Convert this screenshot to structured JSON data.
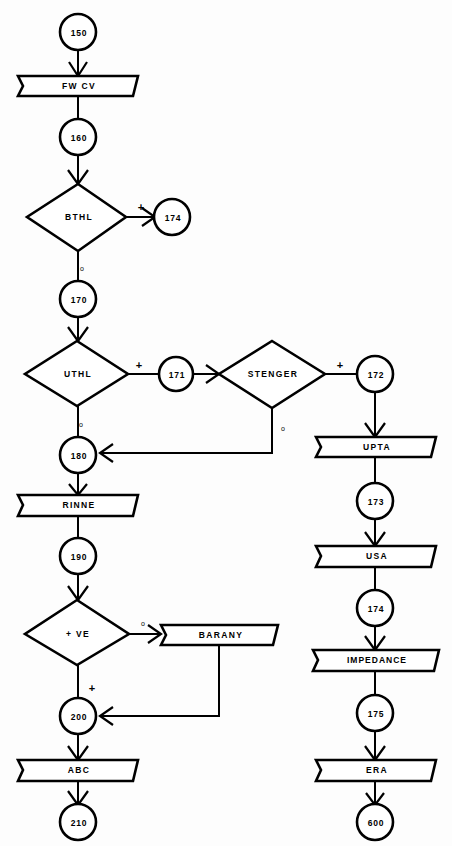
{
  "diagram": {
    "background_color": "#fdfdfd",
    "line_color": "#000000",
    "shape_fill": "#ffffff",
    "branch_markers": {
      "positive": "+",
      "negative": "o"
    }
  },
  "nodes": {
    "n150": {
      "label": "150",
      "shape": "connector",
      "cx": 78,
      "cy": 32
    },
    "fwcv": {
      "label": "FW CV",
      "shape": "process",
      "cx": 78,
      "cy": 86
    },
    "n160": {
      "label": "160",
      "shape": "connector",
      "cx": 78,
      "cy": 137
    },
    "bthl": {
      "label": "BTHL",
      "shape": "decision",
      "cx": 78,
      "cy": 217
    },
    "n174a": {
      "label": "174",
      "shape": "connector",
      "cx": 172,
      "cy": 217
    },
    "n170": {
      "label": "170",
      "shape": "connector",
      "cx": 78,
      "cy": 299
    },
    "uthl": {
      "label": "UTHL",
      "shape": "decision",
      "cx": 77,
      "cy": 374
    },
    "n171": {
      "label": "171",
      "shape": "connector",
      "cx": 176,
      "cy": 375
    },
    "steng": {
      "label": "STENGER",
      "shape": "decision",
      "cx": 272,
      "cy": 374
    },
    "n172": {
      "label": "172",
      "shape": "connector",
      "cx": 375,
      "cy": 375
    },
    "upta": {
      "label": "UPTA",
      "shape": "process",
      "cx": 375,
      "cy": 447
    },
    "n173": {
      "label": "173",
      "shape": "connector",
      "cx": 375,
      "cy": 501
    },
    "usa": {
      "label": "USA",
      "shape": "process",
      "cx": 375,
      "cy": 556
    },
    "n174b": {
      "label": "174",
      "shape": "connector",
      "cx": 375,
      "cy": 608
    },
    "imped": {
      "label": "IMPEDANCE",
      "shape": "process",
      "cx": 375,
      "cy": 660
    },
    "n175": {
      "label": "175",
      "shape": "connector",
      "cx": 375,
      "cy": 713
    },
    "era": {
      "label": "ERA",
      "shape": "process",
      "cx": 375,
      "cy": 770
    },
    "n600": {
      "label": "600",
      "shape": "connector",
      "cx": 375,
      "cy": 822
    },
    "n180": {
      "label": "180",
      "shape": "connector",
      "cx": 78,
      "cy": 455
    },
    "rinne": {
      "label": "RINNE",
      "shape": "process",
      "cx": 78,
      "cy": 505
    },
    "n190": {
      "label": "190",
      "shape": "connector",
      "cx": 78,
      "cy": 556
    },
    "ve": {
      "label": "+ VE",
      "shape": "decision",
      "cx": 77,
      "cy": 632
    },
    "baran": {
      "label": "BARANY",
      "shape": "process",
      "cx": 219,
      "cy": 635
    },
    "n200": {
      "label": "200",
      "shape": "connector",
      "cx": 78,
      "cy": 716
    },
    "abc": {
      "label": "ABC",
      "shape": "process",
      "cx": 78,
      "cy": 770
    },
    "n210": {
      "label": "210",
      "shape": "connector",
      "cx": 78,
      "cy": 822
    }
  },
  "branch_labels": [
    {
      "id": "bthl-plus",
      "text": "+",
      "x": 141,
      "y": 207
    },
    {
      "id": "bthl-o",
      "text": "o",
      "x": 82,
      "y": 268
    },
    {
      "id": "uthl-plus",
      "text": "+",
      "x": 139,
      "y": 365
    },
    {
      "id": "uthl-o",
      "text": "o",
      "x": 81,
      "y": 424
    },
    {
      "id": "stenger-plus",
      "text": "+",
      "x": 340,
      "y": 365
    },
    {
      "id": "stenger-o",
      "text": "o",
      "x": 283,
      "y": 428
    },
    {
      "id": "ve-o",
      "text": "o",
      "x": 143,
      "y": 623
    },
    {
      "id": "ve-plus",
      "text": "+",
      "x": 92,
      "y": 688
    }
  ],
  "edges": [
    {
      "id": "e-150-fwcv",
      "from": "150",
      "to": "FW CV"
    },
    {
      "id": "e-fwcv-160",
      "from": "FW CV",
      "to": "160"
    },
    {
      "id": "e-160-bthl",
      "from": "160",
      "to": "BTHL"
    },
    {
      "id": "e-bthl-174",
      "from": "BTHL",
      "to": "174",
      "branch": "+"
    },
    {
      "id": "e-bthl-170",
      "from": "BTHL",
      "to": "170",
      "branch": "o"
    },
    {
      "id": "e-170-uthl",
      "from": "170",
      "to": "UTHL"
    },
    {
      "id": "e-uthl-171",
      "from": "UTHL",
      "to": "171",
      "branch": "+"
    },
    {
      "id": "e-171-steng",
      "from": "171",
      "to": "STENGER"
    },
    {
      "id": "e-steng-172",
      "from": "STENGER",
      "to": "172",
      "branch": "+"
    },
    {
      "id": "e-steng-180",
      "from": "STENGER",
      "to": "180",
      "branch": "o"
    },
    {
      "id": "e-uthl-180",
      "from": "UTHL",
      "to": "180",
      "branch": "o"
    },
    {
      "id": "e-172-upta",
      "from": "172",
      "to": "UPTA"
    },
    {
      "id": "e-upta-173",
      "from": "UPTA",
      "to": "173"
    },
    {
      "id": "e-173-usa",
      "from": "173",
      "to": "USA"
    },
    {
      "id": "e-usa-174",
      "from": "USA",
      "to": "174"
    },
    {
      "id": "e-174-imped",
      "from": "174",
      "to": "IMPEDANCE"
    },
    {
      "id": "e-imped-175",
      "from": "IMPEDANCE",
      "to": "175"
    },
    {
      "id": "e-175-era",
      "from": "175",
      "to": "ERA"
    },
    {
      "id": "e-era-600",
      "from": "ERA",
      "to": "600"
    },
    {
      "id": "e-180-rinne",
      "from": "180",
      "to": "RINNE"
    },
    {
      "id": "e-rinne-190",
      "from": "RINNE",
      "to": "190"
    },
    {
      "id": "e-190-ve",
      "from": "190",
      "to": "+ VE"
    },
    {
      "id": "e-ve-baran",
      "from": "+ VE",
      "to": "BARANY",
      "branch": "o"
    },
    {
      "id": "e-ve-200",
      "from": "+ VE",
      "to": "200",
      "branch": "+"
    },
    {
      "id": "e-baran-200",
      "from": "BARANY",
      "to": "200"
    },
    {
      "id": "e-200-abc",
      "from": "200",
      "to": "ABC"
    },
    {
      "id": "e-abc-210",
      "from": "ABC",
      "to": "210"
    }
  ]
}
